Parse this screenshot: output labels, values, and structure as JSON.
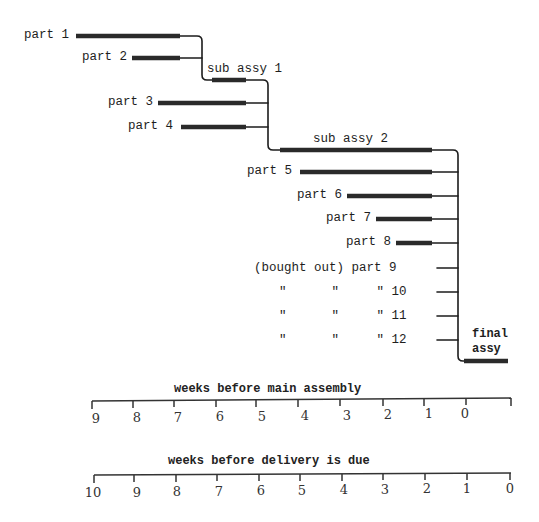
{
  "diagram": {
    "type": "assembly-lead-time-chart",
    "parts": [
      {
        "id": "part1",
        "label": "part 1"
      },
      {
        "id": "part2",
        "label": "part 2"
      },
      {
        "id": "part3",
        "label": "part 3"
      },
      {
        "id": "part4",
        "label": "part 4"
      },
      {
        "id": "part5",
        "label": "part 5"
      },
      {
        "id": "part6",
        "label": "part 6"
      },
      {
        "id": "part7",
        "label": "part 7"
      },
      {
        "id": "part8",
        "label": "part 8"
      },
      {
        "id": "part9",
        "label": "(bought out) part 9"
      },
      {
        "id": "part10",
        "label": "\"      \"     \" 10"
      },
      {
        "id": "part11",
        "label": "\"      \"     \" 11"
      },
      {
        "id": "part12",
        "label": "\"      \"     \" 12"
      }
    ],
    "assemblies": [
      {
        "id": "sub1",
        "label": "sub assy 1"
      },
      {
        "id": "sub2",
        "label": "sub assy 2"
      },
      {
        "id": "final_line1",
        "label": "final"
      },
      {
        "id": "final_line2",
        "label": "assy"
      }
    ],
    "axis_main": {
      "title": "weeks before main assembly",
      "ticks": [
        "9",
        "8",
        "7",
        "6",
        "5",
        "4",
        "3",
        "2",
        "1",
        "0"
      ]
    },
    "axis_delivery": {
      "title": "weeks before delivery is due",
      "ticks": [
        "10",
        "9",
        "8",
        "7",
        "6",
        "5",
        "4",
        "3",
        "2",
        "1",
        "0"
      ]
    }
  }
}
